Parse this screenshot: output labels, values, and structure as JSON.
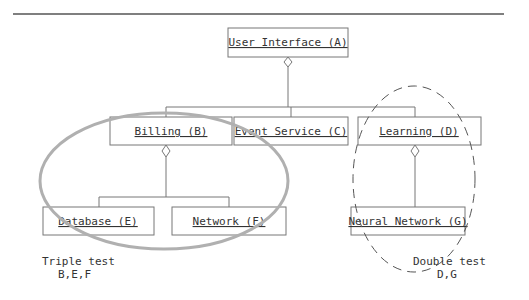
{
  "diagram": {
    "nodes": {
      "a": {
        "label": "User Interface (A)"
      },
      "b": {
        "label": "Billing (B)"
      },
      "c": {
        "label": "Event Service (C)"
      },
      "d": {
        "label": "Learning (D)"
      },
      "e": {
        "label": "Database (E)"
      },
      "f": {
        "label": "Network (F)"
      },
      "g": {
        "label": "Neural Network (G)"
      }
    },
    "groups": {
      "triple": {
        "title": "Triple test",
        "members": "B,E,F",
        "style": "solid-gray-ellipse"
      },
      "double": {
        "title": "Double test",
        "members": "D,G",
        "style": "dashed-ellipse"
      }
    },
    "colors": {
      "line": "#555555",
      "triple_ellipse": "#b0b0b0",
      "text": "#333333"
    }
  }
}
